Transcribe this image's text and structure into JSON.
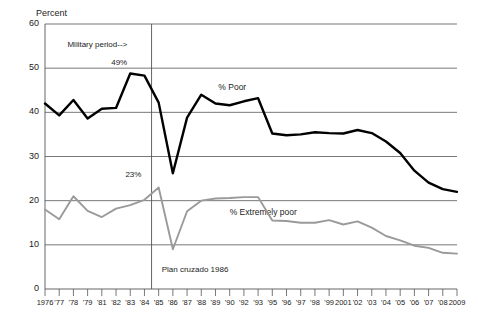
{
  "chart_data": {
    "type": "line",
    "title": "",
    "ylabel": "Percent",
    "xlabel": "",
    "ylim": [
      0,
      60
    ],
    "yticks": [
      0,
      10,
      20,
      30,
      40,
      50,
      60
    ],
    "grid": true,
    "legend_position": "inline-labels",
    "x": [
      "1976",
      "77",
      "78",
      "79",
      "81",
      "82",
      "83",
      "84",
      "85",
      "86",
      "87",
      "88",
      "89",
      "90",
      "92",
      "93",
      "95",
      "96",
      "97",
      "98",
      "99",
      "2001",
      "02",
      "03",
      "04",
      "05",
      "06",
      "07",
      "08",
      "2009"
    ],
    "xtick_labels": [
      "1976",
      "'77",
      "'78",
      "'79",
      "'81",
      "'82",
      "'83",
      "'84",
      "'85",
      "'86",
      "'87",
      "'88",
      "'89",
      "'90",
      "'92",
      "'93",
      "'95",
      "'96",
      "'97",
      "'98",
      "'99",
      "2001",
      "'02",
      "'03",
      "'04",
      "'05",
      "'06",
      "'07",
      "'08",
      "2009"
    ],
    "series": [
      {
        "name": "% Poor",
        "color": "#000000",
        "values": [
          42.0,
          39.3,
          42.8,
          38.6,
          40.8,
          41.0,
          48.8,
          48.3,
          42.2,
          26.2,
          38.8,
          44.0,
          42.0,
          41.6,
          42.5,
          43.2,
          35.2,
          34.8,
          35.0,
          35.5,
          35.3,
          35.2,
          36.0,
          35.3,
          33.4,
          30.8,
          26.8,
          24.1,
          22.6,
          22.0
        ]
      },
      {
        "name": "% Extremely poor",
        "color": "#9a9a9a",
        "values": [
          18.0,
          15.8,
          21.0,
          17.7,
          16.3,
          18.2,
          19.0,
          20.2,
          23.0,
          9.0,
          17.6,
          20.0,
          20.5,
          20.6,
          20.8,
          20.8,
          15.5,
          15.4,
          15.0,
          15.0,
          15.6,
          14.6,
          15.3,
          13.9,
          12.0,
          11.0,
          9.8,
          9.3,
          8.2,
          8.0
        ]
      }
    ],
    "annotations": [
      {
        "name": "military-period",
        "text": "Military period-->",
        "x_index": 6,
        "value": 55.0
      },
      {
        "name": "peak-poor",
        "text": "49%",
        "x_index": 6,
        "value": 51.0
      },
      {
        "name": "peak-extremely-poor",
        "text": "23%",
        "x_index": 7,
        "value": 25.5
      },
      {
        "name": "plan-cruzado",
        "text": "Plan cruzado 1986",
        "x_index": 8,
        "value": 4.0
      }
    ],
    "vertical_marker": {
      "name": "military-period-end",
      "x_index": 7.5,
      "color": "#555555"
    },
    "series_labels": [
      {
        "name": "poor-label",
        "text": "% Poor",
        "x_index": 12.2,
        "value": 45.5
      },
      {
        "name": "extremely-poor-label",
        "text": "% Extremely poor",
        "x_index": 13.0,
        "value": 17.3
      }
    ]
  }
}
